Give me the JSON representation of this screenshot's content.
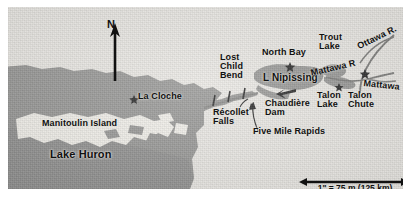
{
  "figure": {
    "kind": "historical-route-map",
    "region": "French River / Lake Nipissing / Mattawa River voyageur route, Ontario",
    "north_letter": "N",
    "north_arrow_icon": "north-arrow-icon"
  },
  "colors": {
    "paper": "#e9e7e2",
    "water": "#8d8d8b",
    "water_dark": "#7c7c7a",
    "land": "#e9e7e2",
    "island_fill": "#f1efe9",
    "ink": "#111111",
    "border": "#ffffff"
  },
  "water_bodies": [
    {
      "id": "lake-huron",
      "label": "Lake Huron",
      "x": 42,
      "y": 148,
      "size": "s11"
    },
    {
      "id": "lake-nipissing",
      "label": "L Nipissing",
      "x": 258,
      "y": 71,
      "size": "s10"
    },
    {
      "id": "trout-lake",
      "label": "Trout\nLake",
      "x": 313,
      "y": 31,
      "size": "s9"
    },
    {
      "id": "talon-lake",
      "label": "Talon\nLake",
      "x": 313,
      "y": 84,
      "size": "s9"
    }
  ],
  "land_features": [
    {
      "id": "manitoulin-island",
      "label": "Manitoulin Island",
      "x": 38,
      "y": 118,
      "size": "s9"
    },
    {
      "id": "la-cloche",
      "label": "La Cloche",
      "x": 133,
      "y": 88,
      "size": "s9",
      "marker": "dot"
    }
  ],
  "rivers": [
    {
      "id": "ottawa-river",
      "label": "Ottawa R.",
      "x": 349,
      "y": 34,
      "size": "s9",
      "rotate_class": "rot-ott"
    },
    {
      "id": "mattawa-river",
      "label": "Mattawa R",
      "x": 305,
      "y": 61,
      "size": "s9",
      "rotate_class": "rot-mat"
    }
  ],
  "settlements": [
    {
      "id": "north-bay",
      "label": "North Bay",
      "x": 259,
      "y": 45,
      "size": "s9",
      "marker": "star"
    },
    {
      "id": "mattawa",
      "label": "Mattawa",
      "x": 364,
      "y": 72,
      "size": "s9",
      "marker": "star",
      "rotate_class": "rot-mtw"
    }
  ],
  "route_sites": [
    {
      "id": "lost-child-bend",
      "label": "Lost\nChild\nBend",
      "x": 218,
      "y": 52,
      "size": "s9"
    },
    {
      "id": "recollet-falls",
      "label": "Récollet\nFalls",
      "x": 219,
      "y": 107,
      "size": "s9"
    },
    {
      "id": "five-mile-rapids",
      "label": "Five Mile Rapids",
      "x": 253,
      "y": 126,
      "size": "s9"
    },
    {
      "id": "chaudiere-dam",
      "label": "Chaudière\nDam",
      "x": 262,
      "y": 95,
      "size": "s9"
    },
    {
      "id": "talon-chute",
      "label": "Talon\nChute",
      "x": 344,
      "y": 84,
      "size": "s9"
    }
  ],
  "scale": {
    "text": "1\" = 75 m (125 km)",
    "bar_icon": "double-arrow-scale-icon"
  }
}
